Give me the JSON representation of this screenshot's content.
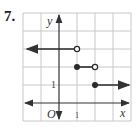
{
  "problem": {
    "number": "7."
  },
  "graph": {
    "type": "step-function",
    "axes": {
      "x_label": "x",
      "y_label": "y",
      "origin_label": "O"
    },
    "tick_labels": {
      "x": "1",
      "y": "1"
    },
    "grid": {
      "x_range": [
        -2,
        4
      ],
      "y_range": [
        -1,
        5
      ],
      "cell_px": 18
    },
    "segments": [
      {
        "y": 3,
        "x_start": "-inf",
        "x_end": 1,
        "start": "arrow",
        "end": "open"
      },
      {
        "y": 2,
        "x_start": 1,
        "x_end": 2,
        "start": "closed",
        "end": "open"
      },
      {
        "y": 1,
        "x_start": 2,
        "x_end": "inf",
        "start": "closed",
        "end": "arrow"
      }
    ],
    "colors": {
      "grid": "#c8c8c8",
      "axis": "#333333",
      "curve": "#2a2a2a"
    }
  }
}
